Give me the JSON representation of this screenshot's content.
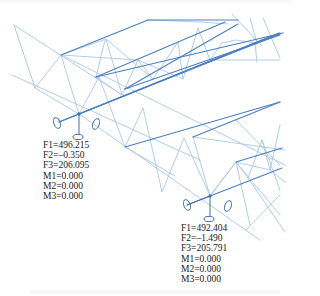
{
  "figure": {
    "colors": {
      "chord": "#4a7fc1",
      "web": "#a9c6e4",
      "support": "#3f6fb0",
      "text": "#222222"
    }
  },
  "supports": [
    {
      "id": "support-1",
      "reactions": {
        "F1": "F1=496.215",
        "F2": "F2=–0.350",
        "F3": "F3=206.095",
        "M1": "M1=0.000",
        "M2": "M2=0.000",
        "M3": "M3=0.000"
      }
    },
    {
      "id": "support-2",
      "reactions": {
        "F1": "F1=492.404",
        "F2": "F2=–1.490",
        "F3": "F3=205.791",
        "M1": "M1=0.000",
        "M2": "M2=0.000",
        "M3": "M3=0.000"
      }
    }
  ]
}
